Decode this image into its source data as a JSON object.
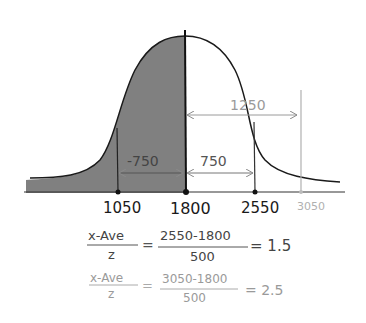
{
  "diagram": {
    "type": "normal-distribution-zscore",
    "colors": {
      "shade": "#808080",
      "ink": "#1a1a1a",
      "gray_ink": "#9a9a9a",
      "light_ink": "#b5b5b5"
    },
    "axis_labels": {
      "x1050": "1050",
      "x1800": "1800",
      "x2550": "2550",
      "x3050": "3050"
    },
    "arrows": {
      "left_span": "-750",
      "right_span": "750",
      "far_span": "1250"
    },
    "equations": [
      {
        "numerator_left": "x-Ave",
        "denominator_left": "z",
        "equals": "=",
        "numerator_right": "2550-1800",
        "denominator_right": "500",
        "result": "= 1.5"
      },
      {
        "numerator_left": "x-Ave",
        "denominator_left": "z",
        "equals": "=",
        "numerator_right": "3050-1800",
        "denominator_right": "500",
        "result": "= 2.5"
      }
    ]
  }
}
